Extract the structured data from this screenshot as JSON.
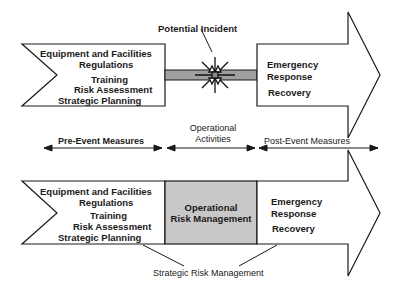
{
  "diagram": {
    "top": {
      "callout": "Potential Incident",
      "left_block_items": [
        "Equipment and Facilities",
        "Regulations",
        "Training",
        "Risk Assessment",
        "Strategic Planning"
      ],
      "right_block_items": [
        "Emergency",
        "Response",
        "Recovery"
      ],
      "incident_icon": "starburst-icon"
    },
    "phases": {
      "pre": "Pre-Event Measures",
      "operational_line1": "Operational",
      "operational_line2": "Activities",
      "post": "Post-Event Measures"
    },
    "bottom": {
      "left_block_items": [
        "Equipment and Facilities",
        "Regulations",
        "Training",
        "Risk Assessment",
        "Strategic Planning"
      ],
      "middle_block_line1": "Operational",
      "middle_block_line2": "Risk Management",
      "right_block_items": [
        "Emergency",
        "Response",
        "Recovery"
      ],
      "footer_label": "Strategic Risk Management"
    },
    "colors": {
      "stroke": "#1a1a1a",
      "fill": "#ffffff",
      "gray_fill": "#c8c8c8",
      "bar_fill": "#a0a0a0"
    }
  }
}
